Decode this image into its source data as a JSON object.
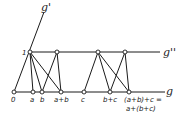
{
  "diagram": {
    "lines": {
      "g": {
        "label": "g"
      },
      "g_prime": {
        "label": "g'"
      },
      "g_double_prime": {
        "label": "g''"
      }
    },
    "points": {
      "origin": {
        "label": "0"
      },
      "unit": {
        "label": "1"
      },
      "a": {
        "label": "a"
      },
      "b": {
        "label": "b"
      },
      "a_plus_b": {
        "label": "a+b"
      },
      "c": {
        "label": "c"
      },
      "b_plus_c": {
        "label": "b+c"
      },
      "result_line1": {
        "label": "(a+b)+c ="
      },
      "result_line2": {
        "label": "a+(b+c)"
      }
    }
  }
}
